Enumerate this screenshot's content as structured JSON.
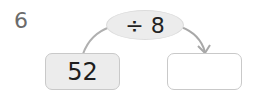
{
  "question": {
    "number": "6",
    "operation": "÷ 8",
    "input_value": "52",
    "answer_value": ""
  },
  "colors": {
    "oval_fill": "#ececec",
    "input_box_fill": "#ececec",
    "answer_box_fill": "#ffffff",
    "border": "#c9c9c9",
    "arrow": "#a8a8a8"
  }
}
